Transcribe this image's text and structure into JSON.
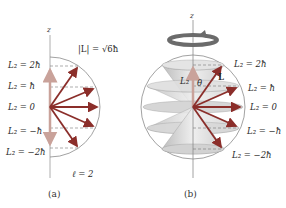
{
  "panel_a": {
    "axis_label": "z",
    "magnitude_label": "|L| = √6ħ",
    "levels": [
      {
        "label": "L₂ = 2ħ",
        "m": 2
      },
      {
        "label": "L₂ = ħ",
        "m": 1
      },
      {
        "label": "L₂ = 0",
        "m": 0
      },
      {
        "label": "L₂ = −ħ",
        "m": -1
      },
      {
        "label": "L₂ = −2ħ",
        "m": -2
      }
    ],
    "ell_label": "ℓ = 2",
    "caption": "(a)"
  },
  "panel_b": {
    "axis_label": "z",
    "lz_label": "L₂",
    "theta_label": "θ",
    "vector_label": "L",
    "levels": [
      {
        "label": "L₂ = 2ħ",
        "m": 2
      },
      {
        "label": "L₂ = ħ",
        "m": 1
      },
      {
        "label": "L₂ = 0",
        "m": 0
      },
      {
        "label": "L₂ = −ħ",
        "m": -1
      },
      {
        "label": "L₂ = −2ħ",
        "m": -2
      }
    ],
    "caption": "(b)"
  },
  "colors": {
    "arrow": "#8b2e2a",
    "axis_arrow": "#c9a29a",
    "circle": "#888888",
    "cone_fill": "#d9d9d9",
    "rotation_arrow": "#6b6b6b"
  }
}
